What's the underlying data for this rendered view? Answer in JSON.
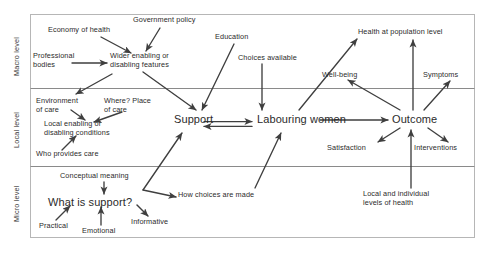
{
  "diagram": {
    "frame": {
      "x": 30,
      "y": 14,
      "width": 445,
      "height": 224,
      "border_color": "#b6b6b6"
    },
    "band_divider_color": "#8a8a8a",
    "arrow_color": "#3f3f3f",
    "text_color": "#2b2b2b",
    "background": "#ffffff",
    "bands": [
      {
        "id": "macro",
        "label": "Macro level",
        "y_top": 14,
        "y_bottom": 88
      },
      {
        "id": "local",
        "label": "Local level",
        "y_top": 88,
        "y_bottom": 166
      },
      {
        "id": "micro",
        "label": "Micro level",
        "y_top": 166,
        "y_bottom": 238
      }
    ],
    "nodes": [
      {
        "id": "economy_of_health",
        "label": "Economy of health",
        "band": "macro",
        "size": "small",
        "x": 48,
        "y": 26,
        "w": 82,
        "align": "left"
      },
      {
        "id": "government_policy",
        "label": "Government policy",
        "band": "macro",
        "size": "small",
        "x": 133,
        "y": 16,
        "w": 88,
        "align": "left"
      },
      {
        "id": "professional_bodies",
        "label": "Professional\nbodies",
        "band": "macro",
        "size": "small",
        "x": 33,
        "y": 52,
        "w": 62,
        "align": "left"
      },
      {
        "id": "wider_features",
        "label": "Wider enabling or\ndisabling features",
        "band": "macro",
        "size": "small",
        "x": 110,
        "y": 52,
        "w": 86,
        "align": "left"
      },
      {
        "id": "education",
        "label": "Education",
        "band": "macro",
        "size": "small",
        "x": 215,
        "y": 33,
        "w": 48,
        "align": "left"
      },
      {
        "id": "choices_available",
        "label": "Choices available",
        "band": "macro",
        "size": "small",
        "x": 238,
        "y": 54,
        "w": 76,
        "align": "left"
      },
      {
        "id": "health_population",
        "label": "Health at population level",
        "band": "macro",
        "size": "small",
        "x": 358,
        "y": 28,
        "w": 120,
        "align": "left"
      },
      {
        "id": "wellbeing",
        "label": "Well-being",
        "band": "macro",
        "size": "small",
        "x": 322,
        "y": 71,
        "w": 50,
        "align": "left"
      },
      {
        "id": "symptoms",
        "label": "Symptoms",
        "band": "macro",
        "size": "small",
        "x": 423,
        "y": 71,
        "w": 48,
        "align": "left"
      },
      {
        "id": "environment_of_care",
        "label": "Environment\nof care",
        "band": "local",
        "size": "small",
        "x": 36,
        "y": 97,
        "w": 62,
        "align": "left"
      },
      {
        "id": "where_place_of_care",
        "label": "Where? Place\nof care",
        "band": "local",
        "size": "small",
        "x": 104,
        "y": 97,
        "w": 64,
        "align": "left"
      },
      {
        "id": "local_conditions",
        "label": "Local enabling or\ndisabling conditions",
        "band": "local",
        "size": "small",
        "x": 44,
        "y": 120,
        "w": 92,
        "align": "left"
      },
      {
        "id": "who_provides_care",
        "label": "Who provides care",
        "band": "local",
        "size": "small",
        "x": 36,
        "y": 150,
        "w": 80,
        "align": "left"
      },
      {
        "id": "support",
        "label": "Support",
        "band": "local",
        "size": "main",
        "x": 174,
        "y": 113,
        "w": 50,
        "align": "left"
      },
      {
        "id": "labouring_women",
        "label": "Labouring women",
        "band": "local",
        "size": "main",
        "x": 257,
        "y": 113,
        "w": 98,
        "align": "left"
      },
      {
        "id": "outcome",
        "label": "Outcome",
        "band": "local",
        "size": "main",
        "x": 392,
        "y": 113,
        "w": 56,
        "align": "left"
      },
      {
        "id": "satisfaction",
        "label": "Satisfaction",
        "band": "local",
        "size": "small",
        "x": 327,
        "y": 144,
        "w": 56,
        "align": "left"
      },
      {
        "id": "interventions",
        "label": "Interventions",
        "band": "local",
        "size": "small",
        "x": 414,
        "y": 144,
        "w": 60,
        "align": "left"
      },
      {
        "id": "conceptual_meaning",
        "label": "Conceptual meaning",
        "band": "micro",
        "size": "small",
        "x": 60,
        "y": 172,
        "w": 90,
        "align": "left"
      },
      {
        "id": "what_is_support",
        "label": "What is support?",
        "band": "micro",
        "size": "main",
        "x": 48,
        "y": 196,
        "w": 110,
        "align": "left"
      },
      {
        "id": "practical",
        "label": "Practical",
        "band": "micro",
        "size": "small",
        "x": 39,
        "y": 222,
        "w": 44,
        "align": "left"
      },
      {
        "id": "emotional",
        "label": "Emotional",
        "band": "micro",
        "size": "small",
        "x": 82,
        "y": 227,
        "w": 46,
        "align": "left"
      },
      {
        "id": "informative",
        "label": "Informative",
        "band": "micro",
        "size": "small",
        "x": 131,
        "y": 218,
        "w": 52,
        "align": "left"
      },
      {
        "id": "how_choices_made",
        "label": "How choices are made",
        "band": "micro",
        "size": "small",
        "x": 178,
        "y": 191,
        "w": 100,
        "align": "left"
      },
      {
        "id": "local_individual",
        "label": "Local and individual\nlevels of health",
        "band": "micro",
        "size": "small",
        "x": 363,
        "y": 190,
        "w": 90,
        "align": "left"
      }
    ],
    "edges": [
      {
        "id": "economy-to-wider",
        "from": "economy_of_health",
        "to": "wider_features",
        "points": "101,37 131,53"
      },
      {
        "id": "policy-to-wider",
        "from": "government_policy",
        "to": "wider_features",
        "points": "160,28 146,51"
      },
      {
        "id": "bodies-to-wider",
        "from": "professional_bodies",
        "to": "wider_features",
        "points": "72,63 107,63"
      },
      {
        "id": "wider-to-support",
        "from": "wider_features",
        "to": "support",
        "points": "143,72 196,110"
      },
      {
        "id": "wider-to-environment",
        "from": "wider_features",
        "to": "environment_of_care",
        "points": "112,74 76,94"
      },
      {
        "id": "education-to-support",
        "from": "education",
        "to": "support",
        "points": "234,44 202,110"
      },
      {
        "id": "choices-to-labouring",
        "from": "choices_available",
        "to": "labouring_women",
        "points": "262,64 262,110"
      },
      {
        "id": "labouring-to-health",
        "from": "labouring_women",
        "to": "health_population",
        "points": "299,110 357,39"
      },
      {
        "id": "environment-to-local",
        "from": "environment_of_care",
        "to": "local_conditions",
        "points": "71,110 85,120"
      },
      {
        "id": "where-to-local",
        "from": "where_place_of_care",
        "to": "local_conditions",
        "points": "122,112 94,122"
      },
      {
        "id": "who-to-local",
        "from": "who_provides_care",
        "to": "local_conditions",
        "points": "62,150 76,136"
      },
      {
        "id": "support-to-labouring",
        "from": "support",
        "to": "labouring_women",
        "points": "204,124 252,124",
        "style": "double"
      },
      {
        "id": "labouring-to-outcome",
        "from": "labouring_women",
        "to": "outcome",
        "points": "320,120 388,120"
      },
      {
        "id": "outcome-to-wellbeing",
        "from": "outcome",
        "to": "wellbeing",
        "points": "400,110 348,80"
      },
      {
        "id": "outcome-to-health",
        "from": "outcome",
        "to": "health_population",
        "points": "413,110 413,40"
      },
      {
        "id": "outcome-to-symptoms",
        "from": "outcome",
        "to": "symptoms",
        "points": "424,110 450,81"
      },
      {
        "id": "outcome-to-satisfaction",
        "from": "outcome",
        "to": "satisfaction",
        "points": "400,128 378,142"
      },
      {
        "id": "outcome-to-interventions",
        "from": "outcome",
        "to": "interventions",
        "points": "428,128 448,142"
      },
      {
        "id": "localindiv-to-outcome",
        "from": "local_individual",
        "to": "outcome",
        "points": "411,188 411,130"
      },
      {
        "id": "conceptual-to-what",
        "from": "conceptual_meaning",
        "to": "what_is_support",
        "points": "104,182 104,194"
      },
      {
        "id": "practical-to-what",
        "from": "practical",
        "to": "what_is_support",
        "points": "56,220 70,206"
      },
      {
        "id": "emotional-to-what",
        "from": "emotional",
        "to": "what_is_support",
        "points": "101,225 101,207"
      },
      {
        "id": "what-to-informative",
        "from": "what_is_support",
        "to": "informative",
        "points": "137,205 148,216"
      },
      {
        "id": "whatsupport-to-support",
        "from": "what_is_support",
        "to": "support",
        "points": "143,190 182,133"
      },
      {
        "id": "whatsupport-to-howchoices",
        "from": "what_is_support",
        "to": "how_choices_made",
        "points": "143,190 176,197"
      },
      {
        "id": "howchoices-to-labouring",
        "from": "how_choices_made",
        "to": "labouring_women",
        "points": "255,188 281,133"
      }
    ]
  }
}
